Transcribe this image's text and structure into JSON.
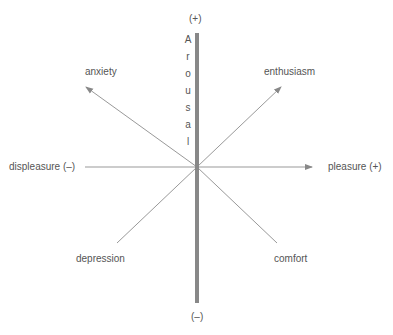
{
  "diagram": {
    "vertical_axis": {
      "label": "Arousal",
      "letters": [
        "A",
        "r",
        "o",
        "u",
        "s",
        "a",
        "l"
      ],
      "top_label": "(+)",
      "bottom_label": "(–)"
    },
    "horizontal_axis": {
      "left_label": "displeasure (–)",
      "right_label": "pleasure (+)"
    },
    "quadrants": {
      "upper_left": "anxiety",
      "upper_right": "enthusiasm",
      "lower_left": "depression",
      "lower_right": "comfort"
    },
    "colors": {
      "vertical_axis": "#888888",
      "lines": "#999999",
      "text": "#555555"
    }
  }
}
